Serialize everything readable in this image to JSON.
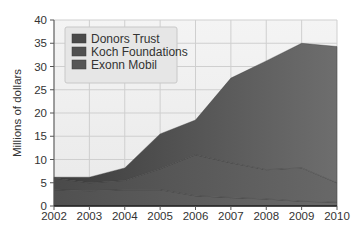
{
  "chart_data": {
    "type": "area",
    "stacked": true,
    "title": "",
    "xlabel": "",
    "ylabel": "Millions of dollars",
    "x": [
      2002,
      2003,
      2004,
      2005,
      2006,
      2007,
      2008,
      2009,
      2010
    ],
    "xticks": [
      "2002",
      "2003",
      "2004",
      "2005",
      "2006",
      "2007",
      "2008",
      "2009",
      "2010"
    ],
    "yticks": [
      "0",
      "5",
      "10",
      "15",
      "20",
      "25",
      "30",
      "35",
      "40"
    ],
    "ylim": [
      0,
      40
    ],
    "grid": true,
    "legend_position": "upper-left",
    "series": [
      {
        "name": "Exonn Mobil",
        "color": "#5e5e5e",
        "values": [
          3.5,
          3.3,
          3.5,
          3.5,
          2.2,
          1.8,
          1.5,
          1.0,
          0.8
        ]
      },
      {
        "name": "Koch Foundations",
        "color": "#575757",
        "values": [
          2.5,
          1.7,
          2.0,
          4.5,
          8.8,
          7.5,
          6.3,
          7.2,
          4.2
        ]
      },
      {
        "name": "Donors Trust",
        "color": "#4a4a4a",
        "values": [
          0.2,
          1.2,
          2.7,
          7.5,
          7.5,
          18.2,
          23.4,
          26.8,
          29.3
        ]
      }
    ],
    "stack_totals": [
      6.2,
      6.2,
      8.2,
      15.5,
      18.5,
      27.5,
      31.2,
      35.0,
      34.3
    ],
    "legend": [
      "Donors Trust",
      "Koch Foundations",
      "Exonn Mobil"
    ]
  }
}
